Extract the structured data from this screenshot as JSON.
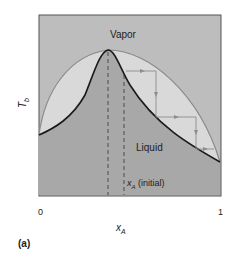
{
  "figure": {
    "panel_label": "(a)",
    "regions": {
      "vapor": "Vapor",
      "liquid": "Liquid"
    },
    "y_axis": {
      "symbol": "T",
      "subscript": "b"
    },
    "x_axis": {
      "symbol": "x",
      "subscript": "A",
      "tick_min": "0",
      "tick_max": "1"
    },
    "annotation": {
      "symbol": "x",
      "subscript": "A",
      "text": " (initial)"
    },
    "colors": {
      "background": "#ffffff",
      "vapor_region": "#bdbdbd",
      "two_phase_region": "#d9d9d9",
      "liquid_region": "#a8a8a8",
      "liquid_curve": "#1a1a1a",
      "vapor_curve": "#8a8a8a",
      "step_lines": "#8c8c8c"
    }
  }
}
